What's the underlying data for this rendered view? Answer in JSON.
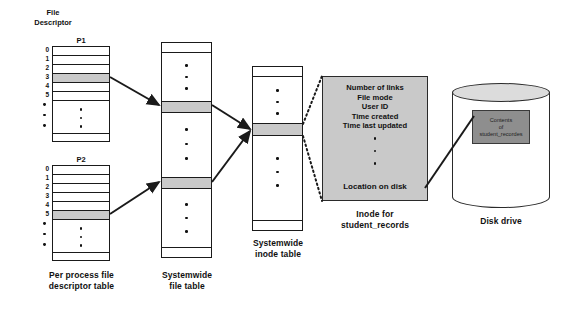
{
  "diagram": {
    "title_labels": {
      "file_descriptor": "File\nDescriptor",
      "file_descriptor_line1": "File",
      "file_descriptor_line2": "Descriptor"
    },
    "captions": {
      "per_process": "Per process file\ndescriptor table",
      "per_process_line1": "Per process file",
      "per_process_line2": "descriptor table",
      "file_table_line1": "Systemwide",
      "file_table_line2": "file table",
      "inode_table_line1": "Systemwide",
      "inode_table_line2": "inode table",
      "inode_box_line1": "Inode for",
      "inode_box_line2": "student_records",
      "disk_drive": "Disk drive"
    },
    "process_tables": [
      {
        "name": "P1",
        "indices": [
          "0",
          "1",
          "2",
          "3",
          "4",
          "5"
        ],
        "highlighted_index": "3"
      },
      {
        "name": "P2",
        "indices": [
          "0",
          "1",
          "2",
          "3",
          "4",
          "5"
        ],
        "highlighted_index": "5"
      }
    ],
    "file_table": {
      "highlighted_rows": 2
    },
    "inode_table": {
      "highlighted_rows": 1
    },
    "inode_fields": [
      "Number of links",
      "File mode",
      "User ID",
      "Time created",
      "Time last updated"
    ],
    "inode_last_field": "Location on disk",
    "disk": {
      "contents_line1": "Contents",
      "contents_line2": "of",
      "contents_line3": "student_recordes"
    },
    "colors": {
      "highlight_gray": "#c9c9c9",
      "panel_gray": "#c9c9c9",
      "contents_gray": "#8e8e8e",
      "stroke": "#1a1a1a",
      "background": "#ffffff"
    }
  }
}
